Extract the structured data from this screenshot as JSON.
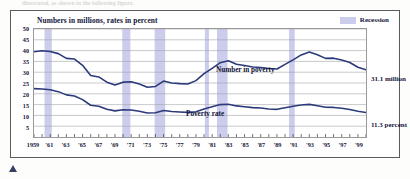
{
  "caption": {
    "text": "illustrated, as shown in the following figure."
  },
  "frame": {
    "title": "Numbers in millions, rates in percent"
  },
  "legend": {
    "label": "Recession",
    "swatch_color": "#ccccec",
    "position": "top-right"
  },
  "annotations": {
    "number_end": "31.1 million",
    "rate_end": "11.3 percent",
    "number_series_label": "Number in poverty",
    "rate_series_label": "Poverty rate"
  },
  "colors": {
    "line": "#2b3a7a",
    "recession_band": "#ccccec",
    "grid": "#9fa3a8",
    "frame": "#5a5a5a",
    "text": "#12143a"
  },
  "chart_data": {
    "type": "line",
    "title": "Numbers in millions, rates in percent",
    "xlabel": "",
    "ylabel": "",
    "ylim": [
      0,
      50
    ],
    "yticks": [
      5,
      10,
      15,
      20,
      25,
      30,
      35,
      40,
      45,
      50
    ],
    "grid": true,
    "legend_position": "top-right",
    "xlim": [
      1959,
      2000
    ],
    "x": [
      1959,
      1960,
      1961,
      1962,
      1963,
      1964,
      1965,
      1966,
      1967,
      1968,
      1969,
      1970,
      1971,
      1972,
      1973,
      1974,
      1975,
      1976,
      1977,
      1978,
      1979,
      1980,
      1981,
      1982,
      1983,
      1984,
      1985,
      1986,
      1987,
      1988,
      1989,
      1990,
      1991,
      1992,
      1993,
      1994,
      1995,
      1996,
      1997,
      1998,
      1999,
      2000
    ],
    "xtick_labels": [
      "1959",
      "'61",
      "'63",
      "'65",
      "'67",
      "'69",
      "'71",
      "'73",
      "'75",
      "'77",
      "'79",
      "'81",
      "'83",
      "'85",
      "'87",
      "'89",
      "'91",
      "'93",
      "'95",
      "'97",
      "'99"
    ],
    "xtick_values": [
      1959,
      1961,
      1963,
      1965,
      1967,
      1969,
      1971,
      1973,
      1975,
      1977,
      1979,
      1981,
      1983,
      1985,
      1987,
      1989,
      1991,
      1993,
      1995,
      1997,
      1999
    ],
    "series": [
      {
        "name": "Number in poverty",
        "unit": "millions",
        "values": [
          39.5,
          39.9,
          39.6,
          38.6,
          36.4,
          36.1,
          33.2,
          28.5,
          27.8,
          25.4,
          24.1,
          25.4,
          25.6,
          24.5,
          23.0,
          23.4,
          25.9,
          25.0,
          24.7,
          24.5,
          26.1,
          29.3,
          31.8,
          34.4,
          35.3,
          33.7,
          33.1,
          32.4,
          32.2,
          31.7,
          31.5,
          33.6,
          35.7,
          38.0,
          39.3,
          38.1,
          36.4,
          36.5,
          35.6,
          34.5,
          32.3,
          31.1
        ],
        "end_label": "31.1 million"
      },
      {
        "name": "Poverty rate",
        "unit": "percent",
        "values": [
          22.4,
          22.2,
          21.9,
          21.0,
          19.5,
          19.0,
          17.3,
          14.7,
          14.2,
          12.8,
          12.1,
          12.6,
          12.5,
          11.9,
          11.1,
          11.2,
          12.3,
          11.8,
          11.6,
          11.4,
          11.7,
          13.0,
          14.0,
          15.0,
          15.2,
          14.4,
          14.0,
          13.6,
          13.4,
          13.0,
          12.8,
          13.5,
          14.2,
          14.8,
          15.1,
          14.5,
          13.8,
          13.7,
          13.3,
          12.7,
          11.9,
          11.3
        ],
        "end_label": "11.3 percent"
      }
    ],
    "recession_bands": [
      {
        "start": 1960.3,
        "end": 1961.2
      },
      {
        "start": 1969.9,
        "end": 1970.9
      },
      {
        "start": 1973.9,
        "end": 1975.2
      },
      {
        "start": 1980.1,
        "end": 1980.6
      },
      {
        "start": 1981.6,
        "end": 1982.9
      },
      {
        "start": 1990.5,
        "end": 1991.2
      }
    ]
  }
}
